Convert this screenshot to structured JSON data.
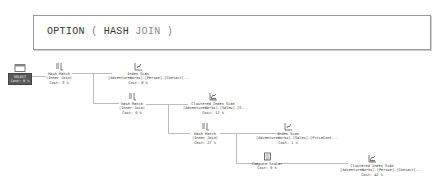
{
  "query_hint": {
    "keyword": "OPTION",
    "open_paren": "(",
    "hint": "HASH",
    "hint2": "JOIN",
    "close_paren": ")"
  },
  "plan": {
    "nodes": [
      {
        "id": "select",
        "op": "SELECT",
        "detail": "",
        "cost": "Cost: 0 %",
        "icon": "select-icon"
      },
      {
        "id": "hash1",
        "op": "Hash Match",
        "detail": "(Inner Join)",
        "cost": "Cost: 3 %",
        "icon": "hash-match-icon"
      },
      {
        "id": "iscan1",
        "op": "Index Scan",
        "detail": "[AdventureWorks].[Person].[Contact]...",
        "cost": "Cost: 8 %",
        "icon": "index-scan-icon"
      },
      {
        "id": "hash2",
        "op": "Hash Match",
        "detail": "(Inner Join)",
        "cost": "Cost: 6 %",
        "icon": "hash-match-icon"
      },
      {
        "id": "ciscan1",
        "op": "Clustered Index Scan",
        "detail": "[AdventureWorks].[Sales].[S...",
        "cost": "Cost: 12 %",
        "icon": "clustered-index-scan-icon"
      },
      {
        "id": "hash3",
        "op": "Hash Match",
        "detail": "(Inner Join)",
        "cost": "Cost: 27 %",
        "icon": "hash-match-icon"
      },
      {
        "id": "iscan2",
        "op": "Index Scan",
        "detail": "[AdventureWorks].[Sales].[PriceCont...",
        "cost": "Cost: 1 %",
        "icon": "index-scan-icon"
      },
      {
        "id": "cscalar",
        "op": "Compute Scalar",
        "detail": "",
        "cost": "Cost: 0 %",
        "icon": "compute-scalar-icon"
      },
      {
        "id": "ciscan2",
        "op": "Clustered Index Scan",
        "detail": "[AdventureWorks].[Person].[Contact]...",
        "cost": "Cost: 42 %",
        "icon": "clustered-index-scan-icon"
      }
    ]
  },
  "colors": {
    "select_bg": "#5a5a5a",
    "line": "#bdbdbd",
    "border": "#9a9a9a"
  }
}
